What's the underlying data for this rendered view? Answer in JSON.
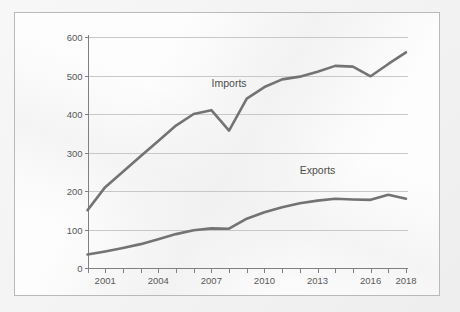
{
  "card": {
    "background_color": "#fdfdfd",
    "border_color": "#b9b9b9"
  },
  "page": {
    "background_color": "#eeeeee"
  },
  "chart_data": {
    "type": "line",
    "title": "",
    "subtitle": "",
    "xlabel": "",
    "ylabel": "",
    "x": [
      2000,
      2001,
      2002,
      2003,
      2004,
      2005,
      2006,
      2007,
      2008,
      2009,
      2010,
      2011,
      2012,
      2013,
      2014,
      2015,
      2016,
      2017,
      2018
    ],
    "xlim": [
      2000,
      2018
    ],
    "ylim": [
      0,
      600
    ],
    "yticks": [
      0,
      100,
      200,
      300,
      400,
      500,
      600
    ],
    "ytick_labels": [
      "0",
      "100",
      "200",
      "300",
      "400",
      "500",
      "600"
    ],
    "xticks": [
      2000,
      2001,
      2002,
      2003,
      2004,
      2005,
      2006,
      2007,
      2008,
      2009,
      2010,
      2011,
      2012,
      2013,
      2014,
      2015,
      2016,
      2017,
      2018
    ],
    "xtick_labels_shown": [
      {
        "x": 2001,
        "label": "2001"
      },
      {
        "x": 2004,
        "label": "2004"
      },
      {
        "x": 2007,
        "label": "2007"
      },
      {
        "x": 2010,
        "label": "2010"
      },
      {
        "x": 2013,
        "label": "2013"
      },
      {
        "x": 2016,
        "label": "2016"
      },
      {
        "x": 2018,
        "label": "2018"
      }
    ],
    "grid": {
      "horizontal": true,
      "vertical": false
    },
    "legend": {
      "position": "inline-annotation"
    },
    "line_color": "#737373",
    "grid_color": "#c8c8c8",
    "axis_color": "#808080",
    "series": [
      {
        "name": "Imports",
        "color": "#737373",
        "annotation": {
          "text": "Imports",
          "x": 2008,
          "y": 470
        },
        "values": [
          150,
          210,
          250,
          290,
          330,
          370,
          400,
          410,
          357,
          440,
          470,
          490,
          497,
          510,
          525,
          523,
          498,
          530,
          560
        ]
      },
      {
        "name": "Exports",
        "color": "#737373",
        "annotation": {
          "text": "Exports",
          "x": 2013,
          "y": 243
        },
        "values": [
          35,
          43,
          52,
          62,
          75,
          88,
          98,
          103,
          102,
          128,
          145,
          158,
          168,
          175,
          180,
          178,
          177,
          190,
          180
        ]
      }
    ]
  }
}
